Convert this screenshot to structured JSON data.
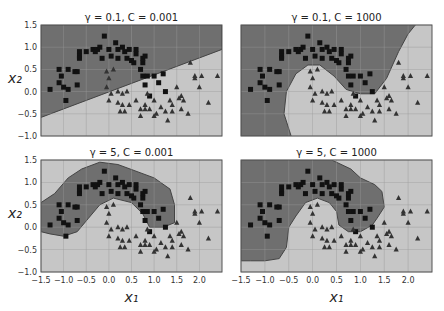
{
  "chart_data": [
    {
      "type": "scatter",
      "title": "γ = 0.1, C = 0.001",
      "xlabel": "",
      "ylabel": "x₂",
      "xlim": [
        -1.5,
        2.5
      ],
      "ylim": [
        -1.0,
        1.5
      ],
      "boundary": "linear"
    },
    {
      "type": "scatter",
      "title": "γ = 0.1, C = 1000",
      "xlabel": "",
      "ylabel": "",
      "xlim": [
        -1.5,
        2.5
      ],
      "ylim": [
        -1.0,
        1.5
      ],
      "boundary": "curved"
    },
    {
      "type": "scatter",
      "title": "γ = 5, C = 0.001",
      "xlabel": "x₁",
      "ylabel": "x₂",
      "xlim": [
        -1.5,
        2.5
      ],
      "ylim": [
        -1.0,
        1.5
      ],
      "boundary": "blob"
    },
    {
      "type": "scatter",
      "title": "γ = 5, C = 1000",
      "xlabel": "x₁",
      "ylabel": "",
      "xlim": [
        -1.5,
        2.5
      ],
      "ylim": [
        -1.0,
        1.5
      ],
      "boundary": "blob-tight"
    }
  ],
  "labels": {
    "xlabel": "x₁",
    "ylabel": "x₂"
  },
  "xticks": [
    "−1.5",
    "−1.0",
    "−0.5",
    "0.0",
    "0.5",
    "1.0",
    "1.5",
    "2.0"
  ],
  "yticks": [
    "1.5",
    "1.0",
    "0.5",
    "0.0",
    "−0.5",
    "−1.0"
  ],
  "colors": {
    "dark": "#6f6f6f",
    "light": "#c6c6c6",
    "frame": "#555",
    "grid": "#9a9a9a"
  },
  "points": {
    "squares": [
      [
        -1.3,
        0.05
      ],
      [
        -1.1,
        0.5
      ],
      [
        -1.05,
        0.35
      ],
      [
        -1.1,
        0.2
      ],
      [
        -1.0,
        0.1
      ],
      [
        -0.95,
        -0.2
      ],
      [
        -0.9,
        0.05
      ],
      [
        -0.9,
        0.5
      ],
      [
        -0.75,
        0.45
      ],
      [
        -0.7,
        0.45
      ],
      [
        -0.7,
        0.15
      ],
      [
        -0.65,
        0.9
      ],
      [
        -0.65,
        0.8
      ],
      [
        -0.65,
        0.75
      ],
      [
        -0.5,
        0.9
      ],
      [
        -0.35,
        0.95
      ],
      [
        -0.3,
        0.9
      ],
      [
        -0.25,
        0.95
      ],
      [
        -0.2,
        1.0
      ],
      [
        -0.15,
        0.75
      ],
      [
        -0.1,
        1.25
      ],
      [
        0.0,
        0.95
      ],
      [
        0.05,
        0.8
      ],
      [
        0.15,
        1.1
      ],
      [
        0.2,
        0.75
      ],
      [
        0.2,
        0.95
      ],
      [
        0.3,
        1.0
      ],
      [
        0.35,
        0.9
      ],
      [
        0.4,
        0.75
      ],
      [
        0.45,
        0.95
      ],
      [
        0.5,
        0.7
      ],
      [
        0.55,
        0.65
      ],
      [
        0.6,
        0.85
      ],
      [
        0.6,
        0.95
      ],
      [
        0.75,
        0.65
      ],
      [
        0.75,
        0.75
      ],
      [
        0.8,
        0.8
      ],
      [
        0.7,
        0.5
      ],
      [
        0.75,
        0.35
      ],
      [
        0.85,
        0.35
      ],
      [
        0.8,
        0.15
      ],
      [
        1.0,
        0.35
      ],
      [
        1.1,
        0.2
      ],
      [
        1.2,
        0.4
      ],
      [
        1.25,
        0.0
      ],
      [
        0.9,
        -0.1
      ]
    ],
    "triangles": [
      [
        -0.05,
        0.45
      ],
      [
        0.0,
        0.3
      ],
      [
        0.1,
        0.5
      ],
      [
        -0.05,
        0.1
      ],
      [
        0.0,
        -0.2
      ],
      [
        0.05,
        -0.05
      ],
      [
        0.2,
        0.0
      ],
      [
        0.3,
        -0.05
      ],
      [
        0.4,
        0.0
      ],
      [
        0.2,
        -0.25
      ],
      [
        0.3,
        -0.3
      ],
      [
        0.35,
        -0.45
      ],
      [
        0.25,
        -0.45
      ],
      [
        0.45,
        -0.3
      ],
      [
        0.6,
        -0.2
      ],
      [
        0.7,
        -0.4
      ],
      [
        0.8,
        -0.3
      ],
      [
        0.7,
        -0.55
      ],
      [
        0.8,
        -0.4
      ],
      [
        0.9,
        -0.4
      ],
      [
        1.0,
        -0.55
      ],
      [
        1.05,
        -0.5
      ],
      [
        1.15,
        -0.35
      ],
      [
        1.25,
        -0.45
      ],
      [
        1.3,
        -0.65
      ],
      [
        1.35,
        -0.2
      ],
      [
        1.4,
        -0.3
      ],
      [
        1.4,
        -0.45
      ],
      [
        1.5,
        0.1
      ],
      [
        1.6,
        -0.1
      ],
      [
        1.65,
        -0.2
      ],
      [
        1.6,
        -0.4
      ],
      [
        1.75,
        -0.5
      ],
      [
        1.8,
        0.65
      ],
      [
        1.9,
        0.35
      ],
      [
        2.0,
        0.1
      ],
      [
        2.05,
        0.35
      ],
      [
        2.2,
        -0.25
      ],
      [
        2.4,
        0.35
      ],
      [
        0.85,
        -0.05
      ],
      [
        1.0,
        -0.2
      ],
      [
        1.55,
        -0.15
      ],
      [
        1.9,
        0.3
      ]
    ]
  }
}
